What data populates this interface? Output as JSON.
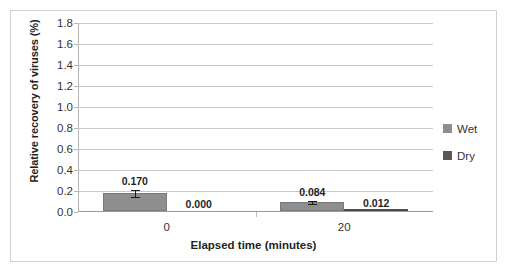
{
  "chart_data": {
    "type": "bar",
    "title": "",
    "xlabel": "Elapsed time (minutes)",
    "ylabel": "Relative recovery of viruses (%)",
    "categories": [
      "0",
      "20"
    ],
    "ylim": [
      0.0,
      1.8
    ],
    "ytick_step": 0.2,
    "ytick_labels": [
      "0.0",
      "0.2",
      "0.4",
      "0.6",
      "0.8",
      "1.0",
      "1.2",
      "1.4",
      "1.6",
      "1.8"
    ],
    "ytick_values": [
      0.0,
      0.2,
      0.4,
      0.6,
      0.8,
      1.0,
      1.2,
      1.4,
      1.6,
      1.8
    ],
    "grid": true,
    "legend_position": "right",
    "series": [
      {
        "name": "Wet",
        "color": "#8e8e8e",
        "values": [
          0.17,
          0.084
        ],
        "labels": [
          "0.170",
          "0.084"
        ],
        "errors": [
          0.035,
          0.022
        ]
      },
      {
        "name": "Dry",
        "color": "#575757",
        "values": [
          0.0,
          0.012
        ],
        "labels": [
          "0.000",
          "0.012"
        ],
        "errors": [
          0.0,
          0.0
        ]
      }
    ]
  },
  "legend": {
    "items": [
      {
        "label": "Wet",
        "color": "#8e8e8e"
      },
      {
        "label": "Dry",
        "color": "#575757"
      }
    ]
  },
  "axes": {
    "y_title": "Relative recovery of viruses (%)",
    "x_title": "Elapsed time (minutes)"
  }
}
